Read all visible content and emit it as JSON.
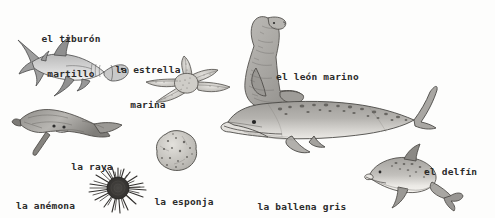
{
  "page": {
    "background_color": "#fdfdfc",
    "ink_color": "#2b2b2b",
    "style": "hand-drawn pencil illustration with handwritten Spanish labels"
  },
  "labels": {
    "hammerhead": {
      "line1": "el tiburón",
      "line2": "martillo"
    },
    "starfish": {
      "line1": "la estrella",
      "line2": "marina"
    },
    "sealion": {
      "line1": "el león marino",
      "line2": ""
    },
    "ray": {
      "line1": "la raya",
      "line2": ""
    },
    "anemone": {
      "line1": "la anémona",
      "line2": ""
    },
    "sponge": {
      "line1": "la esponja",
      "line2": ""
    },
    "whale": {
      "line1": "la ballena gris",
      "line2": ""
    },
    "dolphin": {
      "line1": "el delfín",
      "line2": ""
    }
  },
  "figures": [
    {
      "name": "hammerhead-shark",
      "label_key": "hammerhead",
      "x": 18,
      "y": 38,
      "w": 110,
      "h": 58
    },
    {
      "name": "starfish",
      "label_key": "starfish",
      "x": 142,
      "y": 58,
      "w": 98,
      "h": 58
    },
    {
      "name": "sea-lion",
      "label_key": "sealion",
      "x": 240,
      "y": 12,
      "w": 80,
      "h": 98
    },
    {
      "name": "stingray",
      "label_key": "ray",
      "x": 14,
      "y": 108,
      "w": 110,
      "h": 48
    },
    {
      "name": "sea-anemone",
      "label_key": "anemone",
      "x": 86,
      "y": 168,
      "w": 62,
      "h": 48
    },
    {
      "name": "sponge",
      "label_key": "sponge",
      "x": 152,
      "y": 132,
      "w": 48,
      "h": 42
    },
    {
      "name": "gray-whale",
      "label_key": "whale",
      "x": 222,
      "y": 86,
      "w": 212,
      "h": 86
    },
    {
      "name": "dolphin",
      "label_key": "dolphin",
      "x": 368,
      "y": 146,
      "w": 92,
      "h": 62
    }
  ],
  "colors": {
    "ink": "#3a3a3a",
    "body_light": "#cfcfcf",
    "body_mid": "#aaaaaa",
    "body_dark": "#7d7d7d",
    "belly": "#efefef",
    "paper": "#fdfdfc"
  }
}
